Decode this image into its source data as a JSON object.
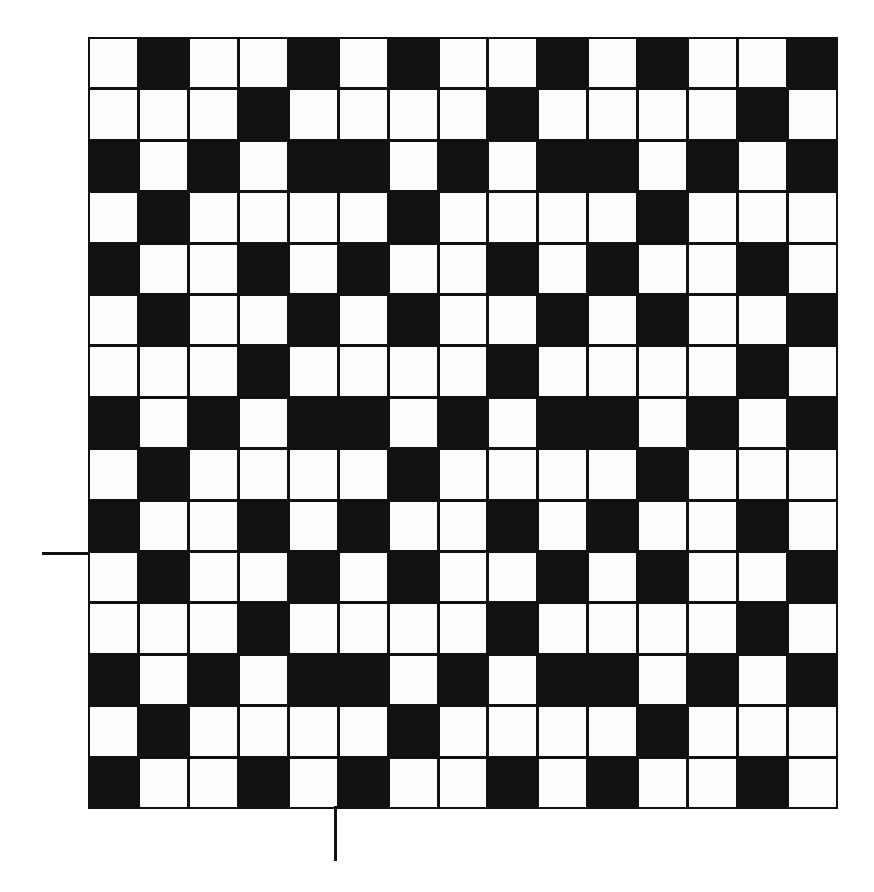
{
  "figure": {
    "type": "binary-grid-pattern",
    "rows": 15,
    "cols": 15,
    "colors": {
      "filled": "#111111",
      "empty": "#fdfdfd",
      "line": "#111111"
    },
    "cells": [
      [
        0,
        1,
        0,
        0,
        1,
        0,
        1,
        0,
        0,
        1,
        0,
        1,
        0,
        0,
        1
      ],
      [
        0,
        0,
        0,
        1,
        0,
        0,
        0,
        0,
        1,
        0,
        0,
        0,
        0,
        1,
        0
      ],
      [
        1,
        0,
        1,
        0,
        1,
        1,
        0,
        1,
        0,
        1,
        1,
        0,
        1,
        0,
        1
      ],
      [
        0,
        1,
        0,
        0,
        0,
        0,
        1,
        0,
        0,
        0,
        0,
        1,
        0,
        0,
        0
      ],
      [
        1,
        0,
        0,
        1,
        0,
        1,
        0,
        0,
        1,
        0,
        1,
        0,
        0,
        1,
        0
      ],
      [
        0,
        1,
        0,
        0,
        1,
        0,
        1,
        0,
        0,
        1,
        0,
        1,
        0,
        0,
        1
      ],
      [
        0,
        0,
        0,
        1,
        0,
        0,
        0,
        0,
        1,
        0,
        0,
        0,
        0,
        1,
        0
      ],
      [
        1,
        0,
        1,
        0,
        1,
        1,
        0,
        1,
        0,
        1,
        1,
        0,
        1,
        0,
        1
      ],
      [
        0,
        1,
        0,
        0,
        0,
        0,
        1,
        0,
        0,
        0,
        0,
        1,
        0,
        0,
        0
      ],
      [
        1,
        0,
        0,
        1,
        0,
        1,
        0,
        0,
        1,
        0,
        1,
        0,
        0,
        1,
        0
      ],
      [
        0,
        1,
        0,
        0,
        1,
        0,
        1,
        0,
        0,
        1,
        0,
        1,
        0,
        0,
        1
      ],
      [
        0,
        0,
        0,
        1,
        0,
        0,
        0,
        0,
        1,
        0,
        0,
        0,
        0,
        1,
        0
      ],
      [
        1,
        0,
        1,
        0,
        1,
        1,
        0,
        1,
        0,
        1,
        1,
        0,
        1,
        0,
        1
      ],
      [
        0,
        1,
        0,
        0,
        0,
        0,
        1,
        0,
        0,
        0,
        0,
        1,
        0,
        0,
        0
      ],
      [
        1,
        0,
        0,
        1,
        0,
        1,
        0,
        0,
        1,
        0,
        1,
        0,
        0,
        1,
        0
      ]
    ],
    "markers": {
      "left_tick_row_boundary": 10,
      "bottom_tick_col_boundary": 5
    }
  }
}
